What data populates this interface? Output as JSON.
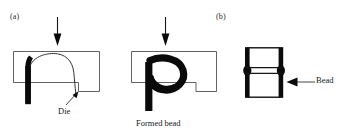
{
  "figure": {
    "background_color": "#ffffff",
    "ink_color": "#0a0a0a",
    "outline_color": "#3a3a3a",
    "panels": [
      {
        "id": "a",
        "label": "(a)",
        "stages": [
          {
            "name": "die-with-tube",
            "annotation": "Die",
            "force_arrow": "downward-force-arrow"
          },
          {
            "name": "die-with-formed-bead",
            "annotation": "Formed bead",
            "force_arrow": "downward-force-arrow"
          }
        ]
      },
      {
        "id": "b",
        "label": "(b)",
        "stages": [
          {
            "name": "finished-beaded-tube",
            "annotation": "Bead",
            "force_arrow": null
          }
        ]
      }
    ]
  },
  "labels": {
    "panel_a": "(a)",
    "panel_b": "(b)",
    "die": "Die",
    "formed_bead": "Formed bead",
    "bead": "Bead"
  },
  "icons": {
    "force_arrow_left": "down-arrow-icon",
    "force_arrow_right": "down-arrow-icon",
    "die_pointer": "leader-arrow-icon",
    "bead_pointer": "leader-arrow-icon"
  }
}
